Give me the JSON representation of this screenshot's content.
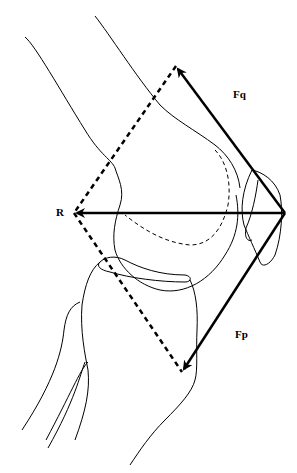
{
  "diagram": {
    "labels": {
      "fq": "Fq",
      "r": "R",
      "fp": "Fp"
    },
    "vectors": [
      {
        "name": "Fq",
        "from": [
          285,
          213
        ],
        "to": [
          176,
          66
        ],
        "style": "solid-arrow"
      },
      {
        "name": "R",
        "from": [
          285,
          213
        ],
        "to": [
          74,
          213
        ],
        "style": "solid-arrow"
      },
      {
        "name": "Fp",
        "from": [
          285,
          213
        ],
        "to": [
          182,
          372
        ],
        "style": "solid-arrow"
      }
    ],
    "construction_lines": [
      {
        "from": [
          176,
          66
        ],
        "to": [
          74,
          213
        ],
        "style": "dashed"
      },
      {
        "from": [
          74,
          213
        ],
        "to": [
          182,
          372
        ],
        "style": "dashed"
      }
    ],
    "colors": {
      "line": "#000000",
      "background": "#ffffff"
    }
  }
}
